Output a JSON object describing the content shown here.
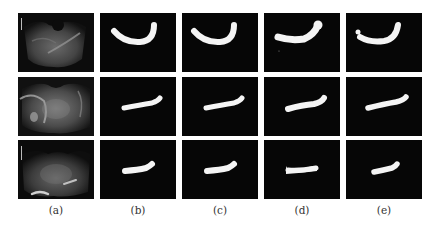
{
  "figure": {
    "columns": [
      {
        "id": "a",
        "caption": "(a)",
        "content": "ultrasound-image"
      },
      {
        "id": "b",
        "caption": "(b)",
        "content": "segmentation-mask"
      },
      {
        "id": "c",
        "caption": "(c)",
        "content": "segmentation-mask"
      },
      {
        "id": "d",
        "caption": "(d)",
        "content": "segmentation-mask"
      },
      {
        "id": "e",
        "caption": "(e)",
        "content": "segmentation-mask"
      }
    ],
    "rows": 3,
    "colors": {
      "background": "#ffffff",
      "panel_background": "#060606",
      "mask": "#f4f4f4",
      "caption_text": "#333333"
    }
  }
}
